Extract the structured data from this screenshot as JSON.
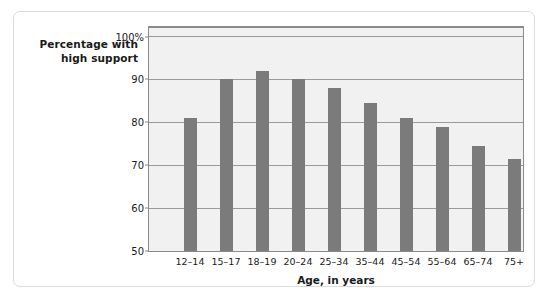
{
  "chart_data": {
    "type": "bar",
    "title": "",
    "ylabel_line1": "Percentage with",
    "ylabel_line2": "high support",
    "xlabel": "Age, in years",
    "categories": [
      "12–14",
      "15–17",
      "18–19",
      "20–24",
      "25–34",
      "35–44",
      "45–54",
      "55–64",
      "65–74",
      "75+"
    ],
    "values": [
      81,
      90,
      92,
      90,
      88,
      84.5,
      81,
      79,
      74.5,
      71.5
    ],
    "ylim": [
      50,
      102
    ],
    "yticks": [
      50,
      60,
      70,
      80,
      90,
      100
    ],
    "ytick_labels": [
      "50",
      "60",
      "70",
      "80",
      "90",
      "100%"
    ],
    "grid": true,
    "legend": "none",
    "bar_color": "#7b7b7b",
    "plot_bg": "#f1f1f1",
    "grid_color": "#9a9a9a"
  }
}
